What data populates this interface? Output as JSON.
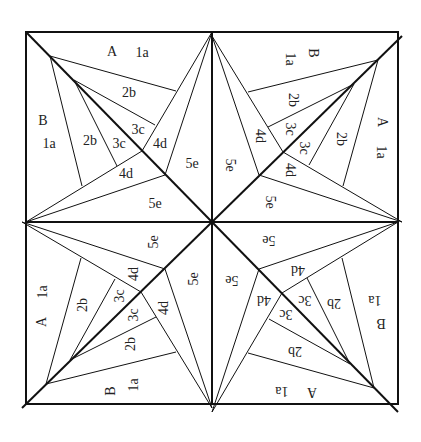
{
  "diagram": {
    "stroke_color": "#111111",
    "background": "#ffffff",
    "frame": {
      "left": 26,
      "top": 32,
      "size": 372
    },
    "center": [
      212,
      222
    ],
    "quadrant_pieces": [
      {
        "text": "A",
        "x": 112,
        "y": 53
      },
      {
        "text": "1a",
        "x": 142,
        "y": 54
      },
      {
        "text": "2b",
        "x": 129,
        "y": 94
      },
      {
        "text": "B",
        "x": 43,
        "y": 122
      },
      {
        "text": "1a",
        "x": 49,
        "y": 145
      },
      {
        "text": "2b",
        "x": 90,
        "y": 142
      },
      {
        "text": "3c",
        "x": 138,
        "y": 131
      },
      {
        "text": "3c",
        "x": 119,
        "y": 145
      },
      {
        "text": "4d",
        "x": 160,
        "y": 145
      },
      {
        "text": "4d",
        "x": 126,
        "y": 175
      },
      {
        "text": "5e",
        "x": 192,
        "y": 165
      },
      {
        "text": "5e",
        "x": 155,
        "y": 205
      }
    ],
    "quadrants": [
      {
        "name": "top-left",
        "rotation": 0
      },
      {
        "name": "top-right",
        "rotation": 90
      },
      {
        "name": "bottom-right",
        "rotation": 180
      },
      {
        "name": "bottom-left",
        "rotation": 270
      }
    ]
  }
}
